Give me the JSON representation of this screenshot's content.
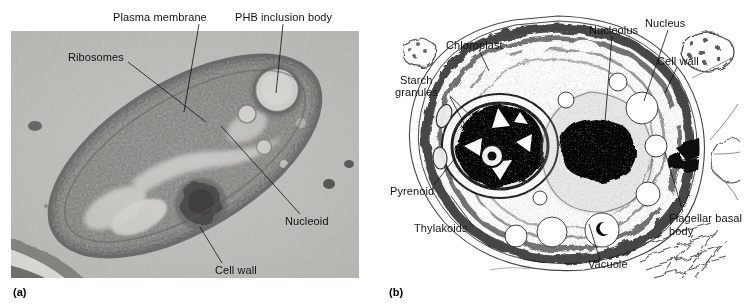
{
  "figure": {
    "panels": [
      {
        "id": "a",
        "panel_label": "(a)",
        "caption_kind": "electron micrograph",
        "subject": "prokaryotic (bacterial) cell thin section",
        "labels": [
          {
            "name": "plasma-membrane",
            "text": "Plasma membrane"
          },
          {
            "name": "phb-inclusion-body",
            "text": "PHB inclusion body"
          },
          {
            "name": "ribosomes",
            "text": "Ribosomes"
          },
          {
            "name": "nucleoid",
            "text": "Nucleoid"
          },
          {
            "name": "cell-wall",
            "text": "Cell wall"
          }
        ]
      },
      {
        "id": "b",
        "panel_label": "(b)",
        "caption_kind": "electron micrograph",
        "subject": "eukaryotic (green algal) cell thin section",
        "labels": [
          {
            "name": "chloroplast",
            "text": "Chloroplast"
          },
          {
            "name": "nucleolus",
            "text": "Nucleolus"
          },
          {
            "name": "nucleus",
            "text": "Nucleus"
          },
          {
            "name": "cell-wall",
            "text": "Cell wall"
          },
          {
            "name": "starch-granules-line1",
            "text": "Starch"
          },
          {
            "name": "starch-granules-line2",
            "text": "granules"
          },
          {
            "name": "pyrenoid",
            "text": "Pyrenoid"
          },
          {
            "name": "thylakoids",
            "text": "Thylakoids"
          },
          {
            "name": "vacuole",
            "text": "Vacuole"
          },
          {
            "name": "flagellar-basal-body-line1",
            "text": "Flagellar basal"
          },
          {
            "name": "flagellar-basal-body-line2",
            "text": "body"
          }
        ]
      }
    ],
    "colors": {
      "page_background": "#ffffff",
      "micrograph_a_background": "#b9b8b4",
      "micrograph_b_background": "#ffffff",
      "label_text": "#111111",
      "leader_line": "#111111"
    }
  }
}
